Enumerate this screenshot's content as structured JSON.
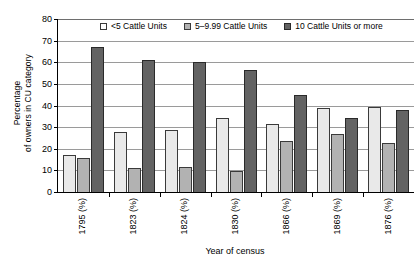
{
  "chart_data": {
    "type": "bar",
    "title": "",
    "xlabel": "Year of census",
    "ylabel_lines": [
      "Percentage",
      "of owners in CU category"
    ],
    "ylabel": "Percentage of owners in CU category",
    "ylim": [
      0,
      80
    ],
    "ytick_step": 10,
    "yticks": [
      0,
      10,
      20,
      30,
      40,
      50,
      60,
      70,
      80
    ],
    "grid": "horizontal",
    "legend_position": "top-inside",
    "categories": [
      "1795 (%)",
      "1823 (%)",
      "1824 (%)",
      "1830 (%)",
      "1866 (%)",
      "1869 (%)",
      "1876 (%)"
    ],
    "series": [
      {
        "name": "<5 Cattle Units",
        "color": "#e9e9e9",
        "values": [
          17.2,
          27.7,
          28.7,
          34.4,
          31.4,
          38.8,
          39.3
        ]
      },
      {
        "name": "5–9.99 Cattle Units",
        "color": "#b2b2b2",
        "values": [
          15.9,
          11.2,
          11.5,
          9.5,
          23.6,
          26.9,
          22.8
        ]
      },
      {
        "name": "10 Cattle Units or more",
        "color": "#636363",
        "values": [
          66.9,
          61.2,
          60.0,
          56.5,
          44.8,
          34.3,
          38.0
        ]
      }
    ]
  },
  "legend": {
    "items": [
      {
        "label": "<5 Cattle Units",
        "swatch": "legend-swatch-light"
      },
      {
        "label": "5–9.99 Cattle Units",
        "swatch": "legend-swatch-mid"
      },
      {
        "label": "10 Cattle Units or more",
        "swatch": "legend-swatch-dark"
      }
    ]
  },
  "axes": {
    "y_title_line1": "Percentage",
    "y_title_line2": "of owners in CU category",
    "x_title": "Year of census"
  },
  "colors": {
    "series_light": "#e9e9e9",
    "series_mid": "#b2b2b2",
    "series_dark": "#636363",
    "gridline": "#9a9a9a",
    "axis": "#000000",
    "background": "#ffffff"
  }
}
